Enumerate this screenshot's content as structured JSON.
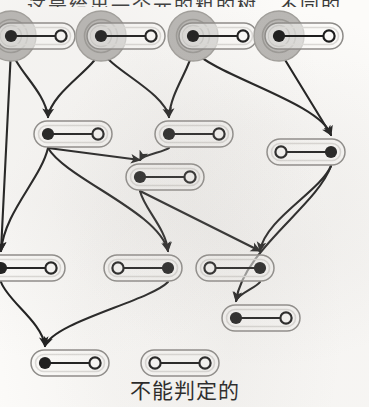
{
  "figure": {
    "caption_top": "这是给出一个元的粗的树。不同的",
    "caption_bottom": "不能判定的",
    "colors": {
      "ink": "#1b1b1b",
      "paper": "#fcfbf9",
      "highlight_fill": "#b9b7b4",
      "capsule_stroke": "#8d8b88",
      "capsule_inner": "#dcdad7"
    },
    "legend": {
      "filled_dot": "marked-place",
      "hollow_dot": "unmarked-place",
      "capsule": "transition-pair",
      "highlight_ring": "initial-state-highlight"
    },
    "node_count": 14,
    "edge_count": 22,
    "nodes": [
      {
        "id": "n1",
        "label": "top-node-1",
        "x": 36,
        "y": 36,
        "orientation": "dot-left",
        "highlight": true
      },
      {
        "id": "n2",
        "label": "top-node-2",
        "x": 126,
        "y": 36,
        "orientation": "dot-left",
        "highlight": true
      },
      {
        "id": "n3",
        "label": "top-node-3",
        "x": 218,
        "y": 36,
        "orientation": "dot-left",
        "highlight": true
      },
      {
        "id": "n4",
        "label": "top-node-4",
        "x": 304,
        "y": 36,
        "orientation": "dot-left",
        "highlight": true
      },
      {
        "id": "n5",
        "label": "mid-node-1",
        "x": 73,
        "y": 134,
        "orientation": "dot-left",
        "highlight": false
      },
      {
        "id": "n6",
        "label": "mid-node-2",
        "x": 194,
        "y": 134,
        "orientation": "dot-left",
        "highlight": false
      },
      {
        "id": "n7",
        "label": "mid-node-3",
        "x": 306,
        "y": 152,
        "orientation": "dot-right",
        "highlight": false
      },
      {
        "id": "n8",
        "label": "mid-node-4",
        "x": 165,
        "y": 177,
        "orientation": "dot-left",
        "highlight": false
      },
      {
        "id": "n9",
        "label": "low-node-1",
        "x": 26,
        "y": 268,
        "orientation": "dot-left",
        "highlight": false
      },
      {
        "id": "n10",
        "label": "low-node-2",
        "x": 143,
        "y": 268,
        "orientation": "dot-right",
        "highlight": false
      },
      {
        "id": "n11",
        "label": "low-node-3",
        "x": 235,
        "y": 268,
        "orientation": "dot-right",
        "highlight": false
      },
      {
        "id": "n12",
        "label": "low-node-4",
        "x": 261,
        "y": 318,
        "orientation": "dot-left",
        "highlight": false
      },
      {
        "id": "n13",
        "label": "bottom-node-1",
        "x": 70,
        "y": 363,
        "orientation": "dot-left",
        "highlight": false
      },
      {
        "id": "n14",
        "label": "bottom-node-2",
        "x": 180,
        "y": 363,
        "orientation": "hollow-both",
        "highlight": false
      }
    ],
    "edges": [
      {
        "from": "n1",
        "to": "n9",
        "shape": "straight"
      },
      {
        "from": "n1",
        "to": "n5",
        "shape": "curved"
      },
      {
        "from": "n2",
        "to": "n5",
        "shape": "curved"
      },
      {
        "from": "n2",
        "to": "n6",
        "shape": "curved"
      },
      {
        "from": "n3",
        "to": "n6",
        "shape": "curved"
      },
      {
        "from": "n3",
        "to": "n7",
        "shape": "curved"
      },
      {
        "from": "n4",
        "to": "n7",
        "shape": "straight"
      },
      {
        "from": "n5",
        "to": "n8",
        "shape": "straight"
      },
      {
        "from": "n5",
        "to": "n9",
        "shape": "curved"
      },
      {
        "from": "n5",
        "to": "n10",
        "shape": "curved"
      },
      {
        "from": "n6",
        "to": "n8",
        "shape": "curved"
      },
      {
        "from": "n8",
        "to": "n10",
        "shape": "curved"
      },
      {
        "from": "n8",
        "to": "n11",
        "shape": "straight"
      },
      {
        "from": "n7",
        "to": "n11",
        "shape": "curved"
      },
      {
        "from": "n7",
        "to": "n12",
        "shape": "curved"
      },
      {
        "from": "n9",
        "to": "n13",
        "shape": "curved"
      },
      {
        "from": "n10",
        "to": "n13",
        "shape": "curved"
      },
      {
        "from": "n11",
        "to": "n12",
        "shape": "curved"
      }
    ]
  }
}
